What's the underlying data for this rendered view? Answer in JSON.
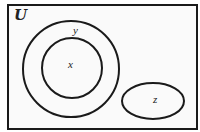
{
  "diagram": {
    "type": "venn",
    "universal_set": {
      "label": "U",
      "display": "𝓤"
    },
    "sets": [
      {
        "id": "y",
        "label": "y",
        "shape": "circle",
        "contains": [
          "x"
        ]
      },
      {
        "id": "x",
        "label": "x",
        "shape": "circle",
        "subset_of": "y"
      },
      {
        "id": "z",
        "label": "z",
        "shape": "ellipse",
        "disjoint_from": [
          "x",
          "y"
        ]
      }
    ],
    "colors": {
      "stroke": "#1a1a1a",
      "background": "#fafafa"
    }
  }
}
